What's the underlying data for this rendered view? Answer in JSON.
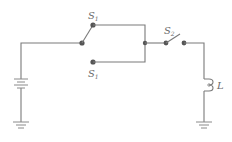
{
  "diagram": {
    "type": "circuit-schematic",
    "labels": {
      "s1_upper": {
        "main": "S",
        "sub": "1"
      },
      "s1_lower": {
        "main": "S",
        "sub": "1"
      },
      "s2": {
        "main": "S",
        "sub": "2"
      },
      "inductor": "L"
    },
    "components": [
      {
        "name": "battery",
        "kind": "voltage-source"
      },
      {
        "name": "switch-s1",
        "kind": "SPDT switch (two-position)",
        "labels": [
          "S1 upper contact",
          "S1 lower contact"
        ],
        "state": "connected to upper contact"
      },
      {
        "name": "switch-s2",
        "kind": "SPST switch",
        "state": "open"
      },
      {
        "name": "inductor-L",
        "kind": "inductor"
      },
      {
        "name": "ground-left",
        "kind": "ground"
      },
      {
        "name": "ground-right",
        "kind": "ground"
      }
    ],
    "colors": {
      "wire": "#7a7a7a",
      "node": "#555555",
      "text": "#6a6a6a",
      "background": "#ffffff"
    }
  }
}
